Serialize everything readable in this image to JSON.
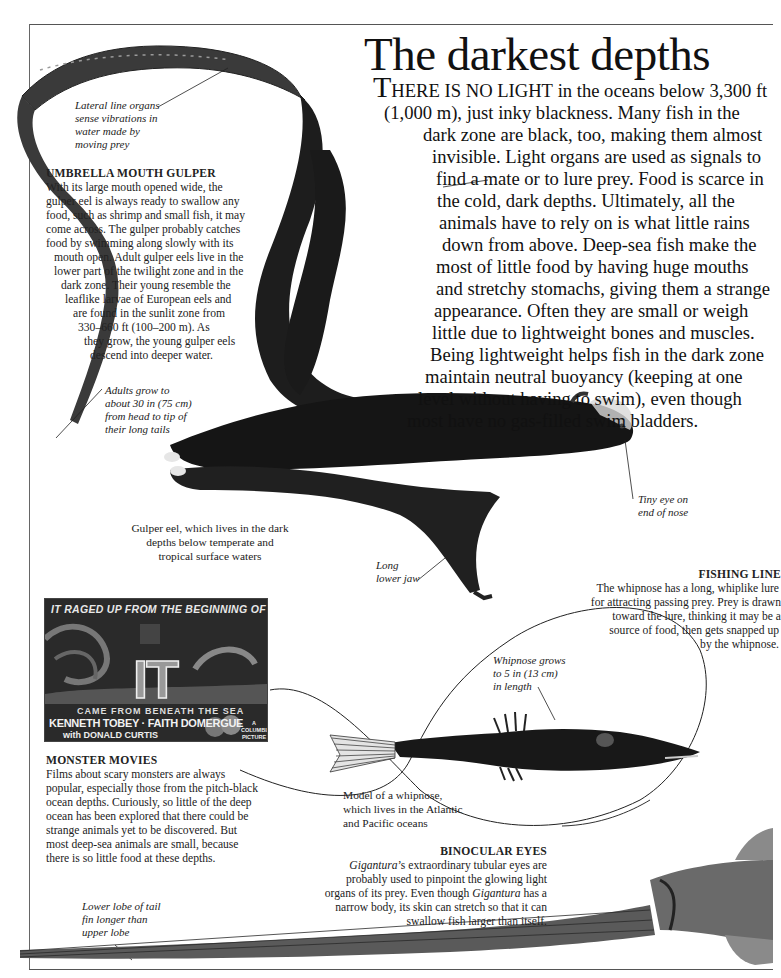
{
  "page": {
    "title": "The darkest depths"
  },
  "intro": {
    "drop_cap": "T",
    "small_caps": "HERE IS NO LIGHT",
    "lines": [
      " in the oceans below 3,300 ft",
      "(1,000 m), just inky blackness. Many fish in the",
      "dark zone are black, too, making them almost",
      "invisible. Light organs are used as signals to",
      "find a mate or to lure prey. Food is scarce in",
      "the cold, dark depths. Ultimately, all the",
      "animals have to rely on is what little rains",
      "down from above. Deep-sea fish make the",
      "most of little food by having huge mouths",
      "and stretchy stomachs, giving them a strange",
      "appearance. Often they are small or weigh",
      "little due to lightweight bones and muscles.",
      "Being lightweight helps fish in the dark zone",
      "maintain neutral buoyancy (keeping at one",
      "level without having to swim), even though",
      "most have no gas-filled swim bladders."
    ]
  },
  "gulper_box": {
    "heading": "UMBRELLA MOUTH GULPER",
    "lines": [
      "With its large mouth opened wide, the",
      "gulper eel is always ready to swallow any",
      "food, such as shrimp and small fish, it may",
      "come across. The gulper probably catches",
      "food by swimming along slowly with its",
      "mouth open. Adult gulper eels live in the",
      "lower part of the twilight zone and in the",
      "dark zone. Their young resemble the",
      "leaflike larvae of European eels and",
      "are found in the sunlit zone from",
      "330–660 ft (100–200 m). As",
      "they grow, the young gulper eels",
      "descend into deeper water."
    ]
  },
  "annotations": {
    "lateral_line": [
      "Lateral line organs",
      "sense vibrations in",
      "water made by",
      "moving prey"
    ],
    "adult_size": [
      "Adults grow to",
      "about 30 in (75 cm)",
      "from head to tip of",
      "their long tails"
    ],
    "tiny_eye": [
      "Tiny eye on",
      "end of nose"
    ],
    "lower_jaw": [
      "Long",
      "lower jaw"
    ],
    "whipnose_size": [
      "Whipnose grows",
      "to 5 in (13 cm)",
      "in length"
    ],
    "tail_lobe": [
      "Lower lobe of tail",
      "fin longer than",
      "upper lobe"
    ]
  },
  "captions": {
    "gulper": [
      "Gulper eel, which lives in the dark",
      "depths below temperate and",
      "tropical surface waters"
    ],
    "whipnose": [
      "Model of a whipnose,",
      "which lives in the Atlantic",
      "and Pacific oceans"
    ]
  },
  "fishing_line_box": {
    "heading": "FISHING LINE",
    "lines": [
      "The whipnose has a long, whiplike lure",
      "for attracting passing prey. Prey is drawn",
      "toward the lure, thinking it may be a",
      "source of food, then gets snapped up",
      "by the whipnose."
    ]
  },
  "monster_box": {
    "heading": "MONSTER MOVIES",
    "lines": [
      "Films about scary monsters are always",
      "popular, especially those from the pitch-black",
      "ocean depths. Curiously, so little of the deep",
      "ocean has been explored that there could be",
      "strange animals yet to be discovered. But",
      "most deep-sea animals are small, because",
      "there is so little food at these depths."
    ]
  },
  "binocular_box": {
    "heading": "BINOCULAR EYES",
    "line1_italic": "Gigantura",
    "line1_rest": "’s extraordinary tubular eyes are",
    "line2": "probably used to pinpoint the glowing light",
    "line3_pre": "organs of its prey. Even though ",
    "line3_italic": "Gigantura",
    "line3_post": " has a",
    "line4": "narrow body, its skin can stretch so that it can",
    "line5": "swallow fish larger than itself."
  },
  "poster": {
    "tagline": "IT RAGED UP FROM THE BEGINNING OF TIME",
    "title": "IT",
    "subtitle": "CAME FROM BENEATH THE SEA",
    "stars": "KENNETH TOBEY · FAITH DOMERGUE",
    "costar": "with DONALD CURTIS",
    "studio": "A COLUMBIA PICTURE"
  },
  "colors": {
    "ink": "#111111",
    "fish_dark": "#151515",
    "frame": "#555555"
  }
}
